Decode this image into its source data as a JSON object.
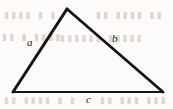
{
  "figure": {
    "background_color": "#fcfbf9",
    "stroke_color": "#141414",
    "labels": {
      "side_a": "a",
      "side_b": "b",
      "side_c": "c"
    }
  },
  "geometry": {
    "vertices": {
      "apex": {
        "x": 67,
        "y": 9
      },
      "bottom_left": {
        "x": 13,
        "y": 92
      },
      "bottom_right": {
        "x": 163,
        "y": 92
      }
    },
    "sides": [
      {
        "name": "a",
        "from": "bottom_left",
        "to": "apex",
        "stroke_width": 3.0
      },
      {
        "name": "b",
        "from": "apex",
        "to": "bottom_right",
        "stroke_width": 2.8
      },
      {
        "name": "c",
        "from": "bottom_left",
        "to": "bottom_right",
        "stroke_width": 2.0
      }
    ]
  },
  "bleed_through": {
    "note": "faint show-through text from the reverse side of the scanned page",
    "lines": {
      "top_left": "▮▮▮▮ ▮ ▮",
      "top_right": "▮▮ ▮▮▮▮ ▮▮",
      "mid_left": "▮▮ ▮ ▮▮▮▮",
      "mid_right": "▮▮▮▮▮▮ ▮▮▮▮▮",
      "bottom_left": "▮▮ ▮▮▮▮ ▮ ▮",
      "bottom_right": "▮▮ ▮▮▮ ▮▮▮"
    }
  }
}
